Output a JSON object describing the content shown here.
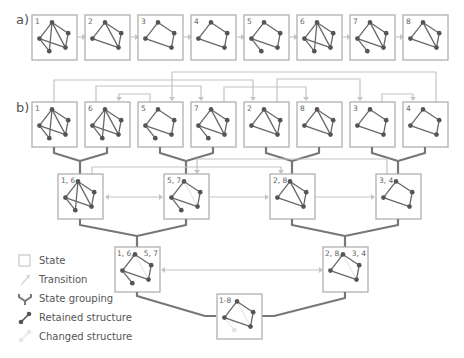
{
  "sections": {
    "a_label": "a)",
    "b_label": "b)"
  },
  "row_a": {
    "states": [
      {
        "label": "1",
        "graph": "full"
      },
      {
        "label": "2",
        "graph": "g2"
      },
      {
        "label": "3",
        "graph": "quad"
      },
      {
        "label": "4",
        "graph": "quad"
      },
      {
        "label": "5",
        "graph": "quad_tail"
      },
      {
        "label": "6",
        "graph": "full"
      },
      {
        "label": "7",
        "graph": "quad_diag_tail"
      },
      {
        "label": "8",
        "graph": "g2"
      }
    ]
  },
  "row_b": {
    "states": [
      {
        "label": "1",
        "graph": "full"
      },
      {
        "label": "6",
        "graph": "full"
      },
      {
        "label": "5",
        "graph": "quad_tail"
      },
      {
        "label": "7",
        "graph": "quad_diag_tail"
      },
      {
        "label": "2",
        "graph": "g2"
      },
      {
        "label": "8",
        "graph": "g2"
      },
      {
        "label": "3",
        "graph": "quad"
      },
      {
        "label": "4",
        "graph": "quad"
      }
    ],
    "transitions": [
      {
        "from": "1",
        "to": "2"
      },
      {
        "from": "2",
        "to": "3"
      },
      {
        "from": "3",
        "to": "4"
      },
      {
        "from": "4",
        "to": "5"
      },
      {
        "from": "5",
        "to": "6"
      },
      {
        "from": "6",
        "to": "7"
      },
      {
        "from": "7",
        "to": "8"
      }
    ]
  },
  "level2": {
    "groups": [
      {
        "label": "1, 6"
      },
      {
        "label": "5, 7"
      },
      {
        "label": "2, 8"
      },
      {
        "label": "3, 4"
      }
    ]
  },
  "level3": {
    "groups": [
      {
        "label_left": "1, 6,",
        "label_right": "5, 7"
      },
      {
        "label_left": "2, 8,",
        "label_right": "3, 4"
      }
    ]
  },
  "root": {
    "label": "1-8"
  },
  "legend": {
    "items": [
      {
        "icon": "state-box-icon",
        "label": "State"
      },
      {
        "icon": "transition-arrow-icon",
        "label": "Transition"
      },
      {
        "icon": "state-grouping-icon",
        "label": "State grouping"
      },
      {
        "icon": "retained-structure-icon",
        "label": "Retained structure"
      },
      {
        "icon": "changed-structure-icon",
        "label": "Changed structure"
      }
    ]
  },
  "colors": {
    "box_border": "#aaaaaa",
    "retained": "#555555",
    "changed": "#dddddd",
    "transition": "#c4c4c4",
    "grouping": "#777777"
  }
}
